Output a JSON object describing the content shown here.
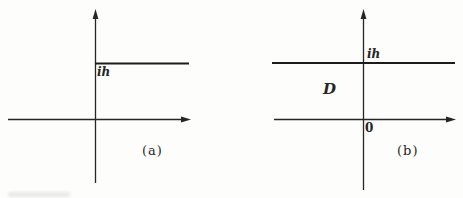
{
  "figure": {
    "type": "complex-plane-diagrams",
    "colors": {
      "ink": "#262626",
      "background": "#fdfdfc"
    },
    "panels": {
      "a": {
        "caption": "(a)",
        "labels": {
          "ih": "ih"
        },
        "description": "Axes with horizontal ray starting on imaginary axis at height ih extending right"
      },
      "b": {
        "caption": "(b)",
        "labels": {
          "ih": "ih",
          "domain": "D",
          "origin": "0"
        },
        "description": "Axes with full horizontal line at height ih; strip region D between real axis and line; origin marked 0"
      }
    }
  }
}
